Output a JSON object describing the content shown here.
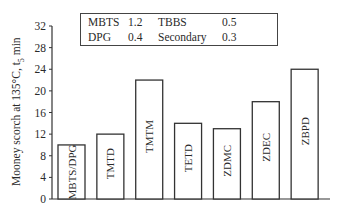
{
  "chart_data": {
    "type": "bar",
    "title": "",
    "xlabel": "",
    "ylabel": "Mooney scorch at 135°C, t5 min",
    "ylim": [
      0,
      32
    ],
    "yticks": [
      0,
      4,
      8,
      12,
      16,
      20,
      24,
      28,
      32
    ],
    "grid": false,
    "categories": [
      "MBTS/DPG",
      "TMTD",
      "TMTM",
      "TETD",
      "ZDMC",
      "ZDEC",
      "ZBPD"
    ],
    "values": [
      10,
      12,
      22,
      14,
      13,
      18,
      24
    ],
    "bar_labels_inside_vertical": true,
    "legend_box": {
      "position": "top",
      "rows": [
        [
          {
            "name": "MBTS",
            "value": "1.2"
          },
          {
            "name": "TBBS",
            "value": "0.5"
          }
        ],
        [
          {
            "name": "DPG",
            "value": "0.4"
          },
          {
            "name": "Secondary",
            "value": "0.3"
          }
        ]
      ]
    }
  },
  "ylabel_parts": {
    "main": "Mooney scorch at 135°C, t",
    "sub": "5",
    "tail": " min"
  },
  "colors": {
    "bar_fill": "#ffffff",
    "bar_stroke": "#333333",
    "axis": "#333333",
    "text": "#2a2a2a"
  }
}
